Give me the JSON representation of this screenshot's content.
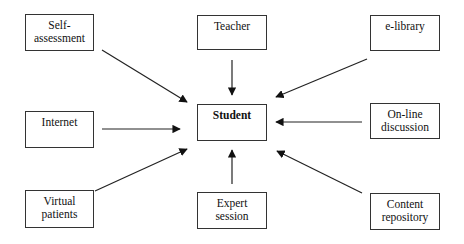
{
  "diagram": {
    "center": {
      "id": "student",
      "label": "Student"
    },
    "nodes": [
      {
        "id": "self-assessment",
        "label_line1": "Self-",
        "label_line2": "assessment"
      },
      {
        "id": "teacher",
        "label_line1": "Teacher",
        "label_line2": ""
      },
      {
        "id": "e-library",
        "label_line1": "e-library",
        "label_line2": ""
      },
      {
        "id": "internet",
        "label_line1": "Internet",
        "label_line2": ""
      },
      {
        "id": "on-line-discussion",
        "label_line1": "On-line",
        "label_line2": "discussion"
      },
      {
        "id": "virtual-patients",
        "label_line1": "Virtual",
        "label_line2": "patients"
      },
      {
        "id": "expert-session",
        "label_line1": "Expert",
        "label_line2": "session"
      },
      {
        "id": "content-repository",
        "label_line1": "Content",
        "label_line2": "repository"
      }
    ],
    "edges": [
      {
        "from": "self-assessment",
        "to": "student"
      },
      {
        "from": "teacher",
        "to": "student"
      },
      {
        "from": "e-library",
        "to": "student"
      },
      {
        "from": "internet",
        "to": "student"
      },
      {
        "from": "on-line-discussion",
        "to": "student"
      },
      {
        "from": "virtual-patients",
        "to": "student"
      },
      {
        "from": "expert-session",
        "to": "student"
      },
      {
        "from": "content-repository",
        "to": "student"
      }
    ]
  }
}
